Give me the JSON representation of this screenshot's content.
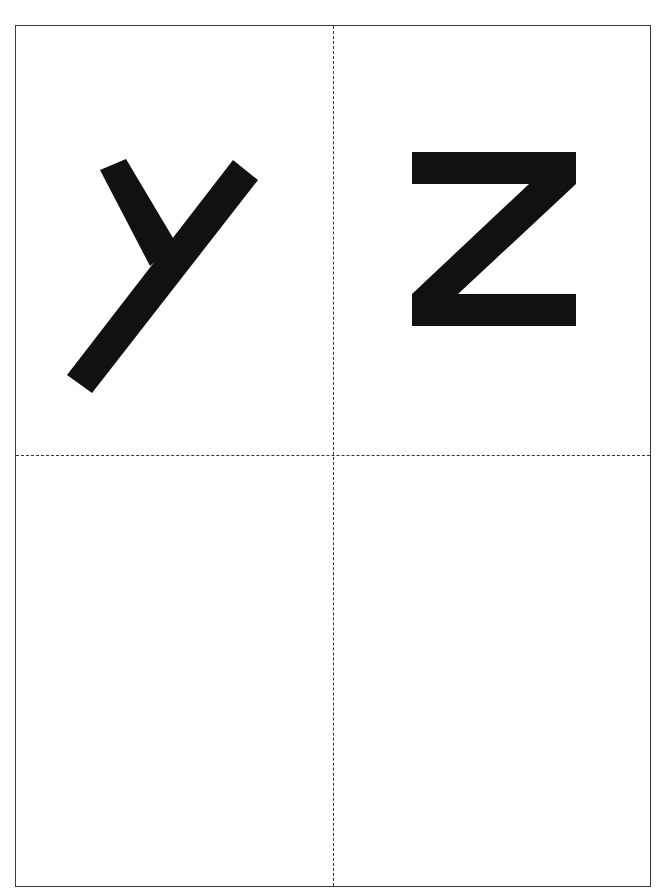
{
  "document": {
    "type": "printable letter flashcard sheet",
    "layout": "2x2 grid with dashed cut lines",
    "cells": [
      {
        "position": "top-left",
        "letter": "y"
      },
      {
        "position": "top-right",
        "letter": "Z"
      },
      {
        "position": "bottom-left",
        "letter": ""
      },
      {
        "position": "bottom-right",
        "letter": ""
      }
    ],
    "colors": {
      "ink": "#111111",
      "border": "#3a3a3a",
      "background": "#ffffff"
    }
  }
}
